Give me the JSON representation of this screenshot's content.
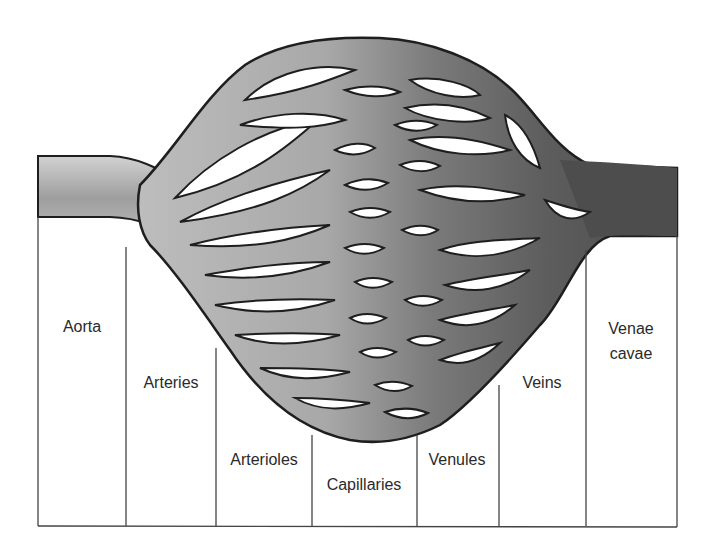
{
  "colors": {
    "arterial_light": "#c8c8c8",
    "arterial_mid": "#9a9a9a",
    "venous_dark": "#5a5a5a",
    "outline": "#1e1e1e",
    "grid_line": "#444444",
    "background": "#ffffff",
    "text": "#2a2a2a"
  },
  "columns": [
    {
      "id": "aorta",
      "label_lines": [
        "Aorta"
      ],
      "x0": 38,
      "x1": 126,
      "top": 217,
      "label_y": 326
    },
    {
      "id": "arteries",
      "label_lines": [
        "Arteries"
      ],
      "x0": 126,
      "x1": 216,
      "top": 247,
      "label_y": 382
    },
    {
      "id": "arterioles",
      "label_lines": [
        "Arterioles"
      ],
      "x0": 216,
      "x1": 312,
      "top": 348,
      "label_y": 459
    },
    {
      "id": "capillaries",
      "label_lines": [
        "Capillaries"
      ],
      "x0": 312,
      "x1": 417,
      "top": 435,
      "label_y": 484
    },
    {
      "id": "venules",
      "label_lines": [
        "Venules"
      ],
      "x0": 417,
      "x1": 499,
      "top": 435,
      "label_y": 459
    },
    {
      "id": "veins",
      "label_lines": [
        "Veins"
      ],
      "x0": 499,
      "x1": 586,
      "top": 340,
      "label_y": 382
    },
    {
      "id": "venae-cavae",
      "label_lines": [
        "Venae",
        "cavae"
      ],
      "x0": 586,
      "x1": 677,
      "top": 236,
      "label_y": 340
    }
  ],
  "labels": {
    "aorta": "Aorta",
    "arteries": "Arteries",
    "arterioles": "Arterioles",
    "capillaries": "Capillaries",
    "venules": "Venules",
    "veins": "Veins",
    "venae_cavae_1": "Venae",
    "venae_cavae_2": "cavae"
  },
  "baseline_y": 526
}
